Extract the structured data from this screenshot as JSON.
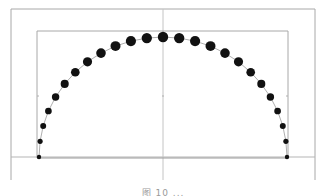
{
  "chart_data": {
    "type": "scatter",
    "title": "",
    "xlabel": "",
    "ylabel": "",
    "xlim": [
      -1,
      1
    ],
    "ylim": [
      0,
      1
    ],
    "grid": false,
    "legend": "none",
    "angles_deg": [
      0,
      7.5,
      15,
      22.5,
      30,
      37.5,
      45,
      52.5,
      60,
      67.5,
      75,
      82.5,
      90,
      97.5,
      105,
      112.5,
      120,
      127.5,
      135,
      142.5,
      150,
      157.5,
      165,
      172.5,
      180
    ],
    "x": [
      1.0,
      0.991,
      0.966,
      0.924,
      0.866,
      0.793,
      0.707,
      0.609,
      0.5,
      0.383,
      0.259,
      0.131,
      0.0,
      -0.131,
      -0.259,
      -0.383,
      -0.5,
      -0.609,
      -0.707,
      -0.793,
      -0.866,
      -0.924,
      -0.966,
      -0.991,
      -1.0
    ],
    "y": [
      0.0,
      0.131,
      0.259,
      0.383,
      0.5,
      0.609,
      0.707,
      0.793,
      0.866,
      0.924,
      0.966,
      0.991,
      1.0,
      0.991,
      0.966,
      0.924,
      0.866,
      0.793,
      0.707,
      0.609,
      0.5,
      0.383,
      0.259,
      0.131,
      0.0
    ],
    "marker_color": "#111111",
    "line_color": "#9a9a9a",
    "frame_color": "#a8a8a8"
  },
  "caption": "图 10    ..."
}
